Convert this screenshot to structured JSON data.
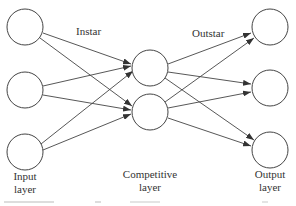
{
  "diagram": {
    "labels": {
      "instar": "Instar",
      "outstar": "Outstar",
      "input_layer_line1": "Input",
      "input_layer_line2": "layer",
      "competitive_layer_line1": "Competitive",
      "competitive_layer_line2": "layer",
      "output_layer_line1": "Output",
      "output_layer_line2": "layer"
    },
    "layers": [
      {
        "name": "Input layer",
        "nodes": 3
      },
      {
        "name": "Competitive layer",
        "nodes": 2
      },
      {
        "name": "Output layer",
        "nodes": 3
      }
    ],
    "connections": [
      {
        "from": "input-1",
        "to": "competitive-1"
      },
      {
        "from": "input-1",
        "to": "competitive-2"
      },
      {
        "from": "input-2",
        "to": "competitive-1"
      },
      {
        "from": "input-2",
        "to": "competitive-2"
      },
      {
        "from": "input-3",
        "to": "competitive-1"
      },
      {
        "from": "input-3",
        "to": "competitive-2"
      },
      {
        "from": "competitive-1",
        "to": "output-1"
      },
      {
        "from": "competitive-1",
        "to": "output-2"
      },
      {
        "from": "competitive-1",
        "to": "output-3"
      },
      {
        "from": "competitive-2",
        "to": "output-1"
      },
      {
        "from": "competitive-2",
        "to": "output-2"
      },
      {
        "from": "competitive-2",
        "to": "output-3"
      }
    ],
    "colors": {
      "stroke": "#444444",
      "text": "#333333",
      "background": "#ffffff"
    }
  }
}
